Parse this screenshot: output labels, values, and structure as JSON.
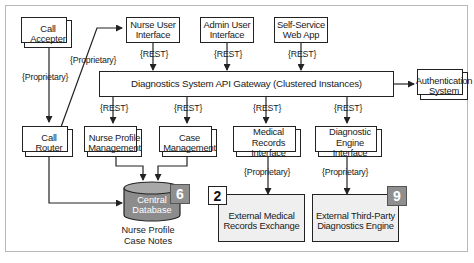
{
  "diagram": {
    "nodes": {
      "call_accepter": {
        "label_l1": "Call",
        "label_l2": "Accepter",
        "stacked": true
      },
      "nurse_ui": {
        "label_l1": "Nurse User",
        "label_l2": "Interface",
        "stacked": false
      },
      "admin_ui": {
        "label_l1": "Admin User",
        "label_l2": "Interface",
        "stacked": false
      },
      "self_service": {
        "label_l1": "Self-Service",
        "label_l2": "Web App",
        "stacked": false
      },
      "gateway": {
        "label": "Diagnostics System API Gateway (Clustered Instances)"
      },
      "auth": {
        "label_l1": "Authentication",
        "label_l2": "System",
        "stacked": true
      },
      "call_router": {
        "label_l1": "Call",
        "label_l2": "Router",
        "stacked": true
      },
      "nurse_profile_mgmt": {
        "label_l1": "Nurse Profile",
        "label_l2": "Management",
        "stacked": true
      },
      "case_mgmt": {
        "label_l1": "Case",
        "label_l2": "Management",
        "stacked": true
      },
      "medical_records_if": {
        "label_l1": "Medical Records",
        "label_l2": "Interface",
        "stacked": true
      },
      "diag_engine_if": {
        "label_l1": "Diagnostic",
        "label_l2": "Engine Interface",
        "stacked": true
      },
      "central_db": {
        "label_l1": "Central",
        "label_l2": "Database",
        "badge": "6",
        "caption_l1": "Nurse Profile",
        "caption_l2": "Case Notes"
      },
      "ext_medical": {
        "label_l1": "External Medical",
        "label_l2": "Records Exchange",
        "badge": "2"
      },
      "ext_diag": {
        "label_l1": "External Third-Party",
        "label_l2": "Diagnostics Engine",
        "badge": "9"
      }
    },
    "edge_labels": {
      "accepter_router": "{Proprietary}",
      "router_nurse_ui": "{Proprietary}",
      "nurse_ui_gw": "{REST}",
      "admin_ui_gw": "{REST}",
      "self_service_gw": "{REST}",
      "gw_nurse_profile": "{REST}",
      "gw_case": "{REST}",
      "gw_medical": "{REST}",
      "gw_diag": "{REST}",
      "medical_ext": "{Proprietary}",
      "diag_ext": "{Proprietary}"
    },
    "colors": {
      "stroke": "#222222",
      "external_fill": "#efefef",
      "db_fill": "#8c8c8c",
      "dark_badge": "#8f8f8f",
      "frame": "#b8b8b8"
    }
  }
}
